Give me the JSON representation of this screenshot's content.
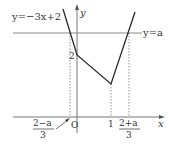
{
  "diagram": {
    "type": "function-graph",
    "colors": {
      "curve": "#2a2a2a",
      "axis": "#777777",
      "guide": "#777777",
      "text": "#333333",
      "background": "#ffffff"
    },
    "labels": {
      "curve_left": "y=−3x+2",
      "line_a": "y=a",
      "y_axis": "y",
      "x_axis": "x",
      "origin": "O",
      "y_intercept": "2",
      "x_one": "1",
      "left_root_num": "2−a",
      "left_root_den": "3",
      "right_root_num": "2+a",
      "right_root_den": "3"
    }
  }
}
